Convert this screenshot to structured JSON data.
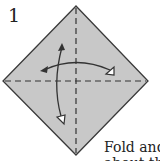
{
  "step": {
    "number": "1"
  },
  "caption": {
    "line1": "Fold and",
    "line2": "about the"
  },
  "colors": {
    "paper": "#c8c8c8",
    "outline": "#3a3a3a",
    "dash": "#333333",
    "arrow": "#333333"
  }
}
